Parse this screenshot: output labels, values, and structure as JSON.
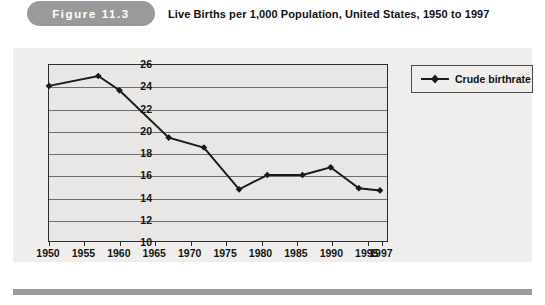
{
  "header": {
    "figure_badge": "Figure  11.3",
    "title": "Live Births per 1,000 Population, United States, 1950 to 1997",
    "badge_color": "#9a9a9a"
  },
  "legend": {
    "entries": [
      {
        "label": "Crude birthrate",
        "color": "#1a1a1a",
        "marker": "diamond"
      }
    ],
    "position": "top-right"
  },
  "chart_data": {
    "type": "line",
    "title": "Live Births per 1,000 Population, United States, 1950 to 1997",
    "xlabel": "",
    "ylabel": "",
    "ylim": [
      10,
      26
    ],
    "ytick_step": 2,
    "yticks": [
      10,
      12,
      14,
      16,
      18,
      20,
      22,
      24,
      26
    ],
    "xlim": [
      1950,
      1998
    ],
    "xtick_labels": [
      "1950",
      "1955",
      "1960",
      "1965",
      "1970",
      "1975",
      "1980",
      "1985",
      "1990",
      "1995",
      "1997"
    ],
    "xticks": [
      1950,
      1955,
      1960,
      1965,
      1970,
      1975,
      1980,
      1985,
      1990,
      1995,
      1997
    ],
    "grid": true,
    "grid_axis": "y",
    "series": [
      {
        "name": "Crude birthrate",
        "color": "#1a1a1a",
        "marker": "diamond",
        "x": [
          1950,
          1957,
          1960,
          1967,
          1972,
          1977,
          1981,
          1986,
          1990,
          1994,
          1997
        ],
        "values": [
          24.1,
          25.0,
          23.7,
          19.4,
          18.5,
          14.7,
          16.0,
          16.0,
          16.7,
          14.8,
          14.6
        ]
      }
    ]
  }
}
